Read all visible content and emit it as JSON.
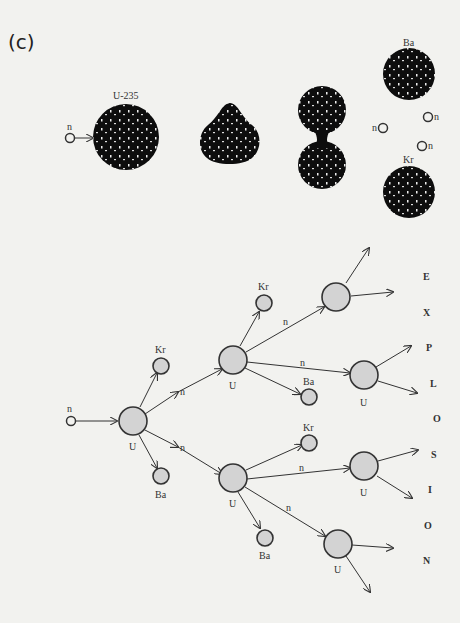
{
  "panel_label": "(c)",
  "top_row": {
    "neutron_label": "n",
    "nucleus_label": "U-235",
    "fragments": {
      "upper": "Ba",
      "lower": "Kr"
    },
    "released_neutrons": [
      "n",
      "n",
      "n"
    ]
  },
  "chain": {
    "input_neutron": "n",
    "nucleus_label": "U",
    "fragment_upper": "Kr",
    "fragment_lower": "Ba",
    "neutron_label": "n"
  },
  "word": [
    "E",
    "X",
    "P",
    "L",
    "O",
    "S",
    "I",
    "O",
    "N"
  ],
  "colors": {
    "nucleus_dark": "#0d0d0d",
    "nucleus_light": "#d3d3d3",
    "stroke": "#333333",
    "background": "#f2f2ef"
  }
}
